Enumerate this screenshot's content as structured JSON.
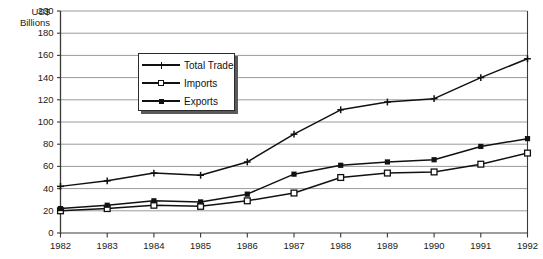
{
  "chart_data": {
    "type": "line",
    "title": "",
    "xlabel": "",
    "ylabel": "US$ Billions",
    "ylabel_line1": "US$",
    "ylabel_line2": "Billions",
    "categories": [
      "1982",
      "1983",
      "1984",
      "1985",
      "1986",
      "1987",
      "1988",
      "1989",
      "1990",
      "1991",
      "1992"
    ],
    "ylim": [
      0,
      200
    ],
    "ytick_step": 20,
    "yticks": [
      "200",
      "180",
      "160",
      "140",
      "120",
      "100",
      "80",
      "60",
      "40",
      "20",
      "0"
    ],
    "grid": true,
    "legend_position": "upper-center-left",
    "series": [
      {
        "name": "Total Trade",
        "marker": "cross",
        "values": [
          42,
          47,
          54,
          52,
          64,
          89,
          111,
          118,
          121,
          140,
          157
        ]
      },
      {
        "name": "Imports",
        "marker": "open-square",
        "values": [
          20,
          22,
          25,
          24,
          29,
          36,
          50,
          54,
          55,
          62,
          72
        ]
      },
      {
        "name": "Exports",
        "marker": "filled-square",
        "values": [
          22,
          25,
          29,
          28,
          35,
          53,
          61,
          64,
          66,
          78,
          85
        ]
      }
    ]
  },
  "colors": {
    "line": "#111111",
    "grid": "#9a9a9a",
    "axis": "#3a3a3a",
    "text": "#1a1a1a",
    "legend_border": "#2b2b2b",
    "legend_shadow": "#5a5a5a",
    "background": "#ffffff"
  }
}
